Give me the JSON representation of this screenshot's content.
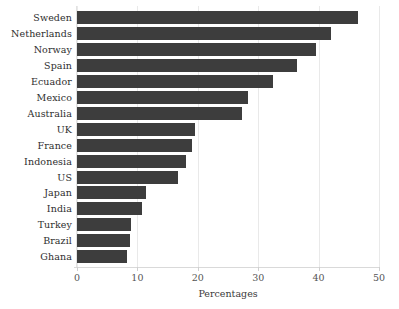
{
  "chart_data": {
    "type": "bar",
    "orientation": "horizontal",
    "title": "",
    "xlabel": "Percentages",
    "ylabel": "",
    "xlim": [
      0,
      50
    ],
    "ylim": [
      0,
      16
    ],
    "xticks": [
      "0",
      "10",
      "20",
      "30",
      "40",
      "50"
    ],
    "xtick_values": [
      0,
      10,
      20,
      30,
      40,
      50
    ],
    "grid": "vertical",
    "legend": "none",
    "bar_color": "#3d3d3d",
    "background_color": "#ffffff",
    "gridline_color": "#e9e9e9",
    "categories": [
      "Sweden",
      "Netherlands",
      "Norway",
      "Spain",
      "Ecuador",
      "Mexico",
      "Australia",
      "UK",
      "France",
      "Indonesia",
      "US",
      "Japan",
      "India",
      "Turkey",
      "Brazil",
      "Ghana"
    ],
    "values": [
      46.5,
      42.0,
      39.5,
      36.5,
      32.5,
      28.3,
      27.4,
      19.5,
      19.1,
      18.0,
      16.7,
      11.4,
      10.7,
      8.9,
      8.8,
      8.3
    ]
  }
}
